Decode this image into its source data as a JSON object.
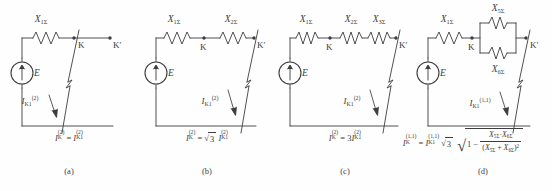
{
  "figure": {
    "type": "circuit-diagram-set",
    "background_color": "#fefefe",
    "line_color": "#3d3d3d",
    "panel_count": 4
  },
  "panels": [
    {
      "id": "a",
      "label": "(a)",
      "source_label": "E",
      "reactances": [
        "X1Σ"
      ],
      "reactance_labels": [
        {
          "base": "X",
          "sub": "1Σ"
        }
      ],
      "nodes": [
        "K",
        "K'"
      ],
      "current_label": {
        "base": "I",
        "sub": "K1",
        "sup": "(2)"
      },
      "formula_text": "I K(2) = I K1(2)",
      "formula_parts": {
        "lhs": {
          "base": "I",
          "sub": "K",
          "sup": "(2)"
        },
        "rel": "=",
        "rhs": {
          "base": "I",
          "sub": "K1",
          "sup": "(2)"
        }
      }
    },
    {
      "id": "b",
      "label": "(b)",
      "source_label": "E",
      "reactances": [
        "X1Σ",
        "X2Σ"
      ],
      "reactance_labels": [
        {
          "base": "X",
          "sub": "1Σ"
        },
        {
          "base": "X",
          "sub": "2Σ"
        }
      ],
      "nodes": [
        "K",
        "K'"
      ],
      "current_label": {
        "base": "I",
        "sub": "K1",
        "sup": "(2)"
      },
      "formula_text": "I K(2) = √3 I K1(2)",
      "formula_parts": {
        "lhs": {
          "base": "I",
          "sub": "K",
          "sup": "(2)"
        },
        "rel": "=",
        "coef": "√3",
        "rhs": {
          "base": "I",
          "sub": "K1",
          "sup": "(2)"
        }
      }
    },
    {
      "id": "c",
      "label": "(c)",
      "source_label": "E",
      "reactances": [
        "X1Σ",
        "X2Σ",
        "X3Σ"
      ],
      "reactance_labels": [
        {
          "base": "X",
          "sub": "1Σ"
        },
        {
          "base": "X",
          "sub": "2Σ"
        },
        {
          "base": "X",
          "sub": "3Σ"
        }
      ],
      "nodes": [
        "K",
        "K'"
      ],
      "current_label": {
        "base": "I",
        "sub": "K1",
        "sup": "(2)"
      },
      "formula_text": "I K(2) = 3 I K1(2)",
      "formula_parts": {
        "lhs": {
          "base": "I",
          "sub": "K",
          "sup": "(2)"
        },
        "rel": "=",
        "coef": "3",
        "rhs": {
          "base": "I",
          "sub": "K1",
          "sup": "(2)"
        }
      }
    },
    {
      "id": "d",
      "label": "(d)",
      "source_label": "E",
      "reactances": [
        "X1Σ",
        "X5Σ",
        "X6Σ"
      ],
      "reactance_labels": [
        {
          "base": "X",
          "sub": "1Σ"
        },
        {
          "base": "X",
          "sub": "5Σ"
        },
        {
          "base": "X",
          "sub": "6Σ"
        }
      ],
      "parallel_branch": {
        "top": {
          "base": "X",
          "sub": "5Σ"
        },
        "bottom": {
          "base": "X",
          "sub": "6Σ"
        }
      },
      "nodes": [
        "K",
        "K'"
      ],
      "current_label": {
        "base": "I",
        "sub": "K1",
        "sup": "(1,1)"
      },
      "formula_text": "I K(1,1) = I K1(1,1) √3 √(1 − X5Σ·X6Σ / (X5Σ + X6Σ)²)",
      "formula_parts": {
        "lhs": {
          "base": "I",
          "sub": "K",
          "sup": "(1,1)"
        },
        "rel": "=",
        "rhs": {
          "base": "I",
          "sub": "K1",
          "sup": "(1,1)"
        },
        "coef": "√3",
        "radical": {
          "lead": "1",
          "minus": "−",
          "numerator": "X5Σ · X6Σ",
          "denominator": "(X5Σ + X6Σ)²"
        }
      }
    }
  ],
  "symbols": {
    "source_icon": "voltage-source-circle-with-up-arrow",
    "reactance_icon": "zigzag-inductor",
    "fault_icon": "diagonal-arc-line",
    "node_icon": "filled-dot",
    "sigma": "Σ",
    "radical": "√",
    "minus": "−",
    "dot": "·",
    "equals": "=",
    "prime": "′"
  }
}
